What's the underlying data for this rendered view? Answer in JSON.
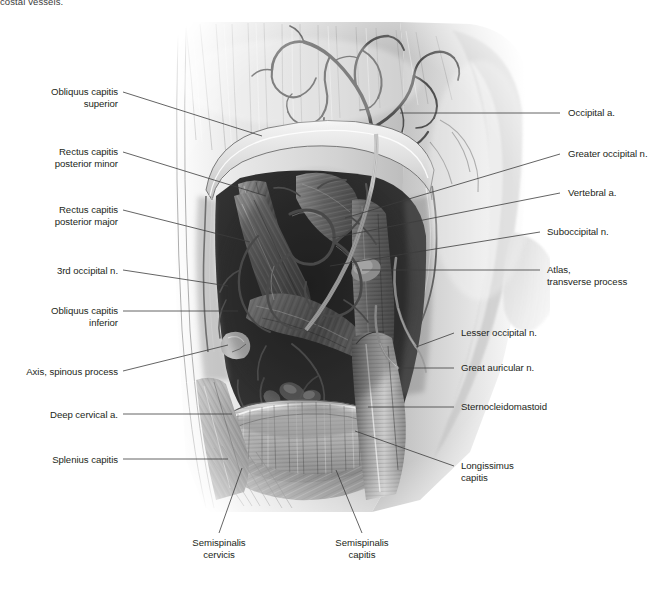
{
  "page": {
    "top_caption": "costal vessels.",
    "figure_title": "Suboccipital region — deep dissection of the posterior neck",
    "background": "#ffffff",
    "ink": "#231f20",
    "leader_color": "#3c3c3c"
  },
  "labels_left": [
    {
      "id": "obliquus-capitis-superior",
      "text": "Obliquus capitis\nsuperior",
      "x": 38,
      "y": 86,
      "w": 80,
      "line": {
        "x1": 123,
        "y1": 92,
        "x2": 262,
        "y2": 136
      }
    },
    {
      "id": "rectus-capitis-posterior-minor",
      "text": "Rectus capitis\nposterior minor",
      "x": 28,
      "y": 146,
      "w": 90,
      "line": {
        "x1": 123,
        "y1": 152,
        "x2": 266,
        "y2": 196
      }
    },
    {
      "id": "rectus-capitis-posterior-major",
      "text": "Rectus capitis\nposterior major",
      "x": 28,
      "y": 204,
      "w": 90,
      "line": {
        "x1": 123,
        "y1": 210,
        "x2": 250,
        "y2": 242
      }
    },
    {
      "id": "third-occipital-n",
      "text": "3rd occipital n.",
      "x": 40,
      "y": 265,
      "w": 78,
      "line": {
        "x1": 123,
        "y1": 270,
        "x2": 228,
        "y2": 286
      }
    },
    {
      "id": "obliquus-capitis-inferior",
      "text": "Obliquus capitis\ninferior",
      "x": 36,
      "y": 305,
      "w": 82,
      "line": {
        "x1": 123,
        "y1": 311,
        "x2": 238,
        "y2": 311
      }
    },
    {
      "id": "axis-spinous-process",
      "text": "Axis, spinous process",
      "x": 18,
      "y": 366,
      "w": 100,
      "line": {
        "x1": 123,
        "y1": 371,
        "x2": 228,
        "y2": 345
      }
    },
    {
      "id": "deep-cervical-a",
      "text": "Deep cervical a.",
      "x": 40,
      "y": 409,
      "w": 78,
      "line": {
        "x1": 123,
        "y1": 414,
        "x2": 232,
        "y2": 414
      }
    },
    {
      "id": "splenius-capitis",
      "text": "Splenius capitis",
      "x": 42,
      "y": 454,
      "w": 76,
      "line": {
        "x1": 123,
        "y1": 459,
        "x2": 228,
        "y2": 459
      }
    }
  ],
  "labels_right": [
    {
      "id": "occipital-a",
      "text": "Occipital a.",
      "x": 568,
      "y": 107,
      "line": {
        "x1": 560,
        "y1": 113,
        "x2": 400,
        "y2": 113
      }
    },
    {
      "id": "greater-occipital-n",
      "text": "Greater occipital n.",
      "x": 568,
      "y": 148,
      "line": {
        "x1": 560,
        "y1": 154,
        "x2": 345,
        "y2": 218
      }
    },
    {
      "id": "vertebral-a",
      "text": "Vertebral a.",
      "x": 568,
      "y": 187,
      "line": {
        "x1": 560,
        "y1": 193,
        "x2": 332,
        "y2": 238
      }
    },
    {
      "id": "suboccipital-n",
      "text": "Suboccipital n.",
      "x": 547,
      "y": 226,
      "line": {
        "x1": 540,
        "y1": 232,
        "x2": 330,
        "y2": 266
      }
    },
    {
      "id": "atlas-transverse-process",
      "text": "Atlas,\ntransverse process",
      "x": 547,
      "y": 264,
      "line": {
        "x1": 540,
        "y1": 270,
        "x2": 362,
        "y2": 270
      }
    },
    {
      "id": "lesser-occipital-n",
      "text": "Lesser occipital n.",
      "x": 461,
      "y": 327,
      "line": {
        "x1": 454,
        "y1": 333,
        "x2": 416,
        "y2": 347
      }
    },
    {
      "id": "great-auricular-n",
      "text": "Great auricular n.",
      "x": 461,
      "y": 362,
      "line": {
        "x1": 454,
        "y1": 368,
        "x2": 398,
        "y2": 368
      }
    },
    {
      "id": "sternocleidomastoid",
      "text": "Sternocleidomastoid",
      "x": 461,
      "y": 401,
      "line": {
        "x1": 454,
        "y1": 407,
        "x2": 368,
        "y2": 407
      }
    },
    {
      "id": "longissimus-capitis",
      "text": "Longissimus\ncapitis",
      "x": 461,
      "y": 460,
      "line": {
        "x1": 454,
        "y1": 466,
        "x2": 355,
        "y2": 431
      }
    }
  ],
  "labels_bottom": [
    {
      "id": "semispinalis-cervicis",
      "text": "Semispinalis\ncervicis",
      "x": 180,
      "y": 537,
      "w": 78,
      "line": {
        "x1": 219,
        "y1": 533,
        "x2": 242,
        "y2": 468
      }
    },
    {
      "id": "semispinalis-capitis",
      "text": "Semispinalis\ncapitis",
      "x": 325,
      "y": 537,
      "w": 74,
      "line": {
        "x1": 362,
        "y1": 533,
        "x2": 336,
        "y2": 470
      }
    }
  ]
}
